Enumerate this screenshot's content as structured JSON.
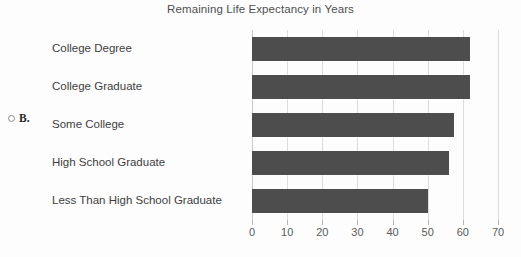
{
  "figure": {
    "title": "Remaining Life Expectancy in Years",
    "option_letter": "B.",
    "option_radio_icon": "radio-unselected-icon",
    "bar_color": "#4d4d4d",
    "gridline_color": "#dcdcdc",
    "text_color": "#3d3d3d"
  },
  "chart_data": {
    "type": "bar",
    "orientation": "horizontal",
    "title": "Remaining Life Expectancy in Years",
    "xlabel": "",
    "ylabel": "",
    "categories": [
      "College Degree",
      "College Graduate",
      "Some College",
      "High School Graduate",
      "Less Than High School Graduate"
    ],
    "values": [
      62,
      62,
      57.5,
      56,
      50
    ],
    "xlim": [
      0,
      70
    ],
    "xticks": [
      0,
      10,
      20,
      30,
      40,
      50,
      60,
      70
    ],
    "xticklabels": [
      "0",
      "10",
      "20",
      "30",
      "40",
      "50",
      "60",
      "70"
    ],
    "grid": true,
    "grid_axis": "x",
    "legend": false
  }
}
